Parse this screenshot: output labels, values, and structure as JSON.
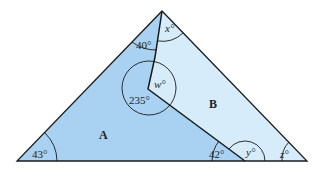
{
  "diagram": {
    "colors": {
      "region_a": "#a9d2f2",
      "region_b": "#d6ecfa",
      "stroke": "#1a1a1a"
    },
    "regions": {
      "a": "A",
      "b": "B"
    },
    "angles": {
      "apex_left": "40°",
      "apex_right": "x°",
      "reflex": "235°",
      "inner": "w°",
      "bottom_left": "43°",
      "bottom_mid_left": "42°",
      "bottom_mid_right": "y°",
      "bottom_right": "z°"
    }
  }
}
